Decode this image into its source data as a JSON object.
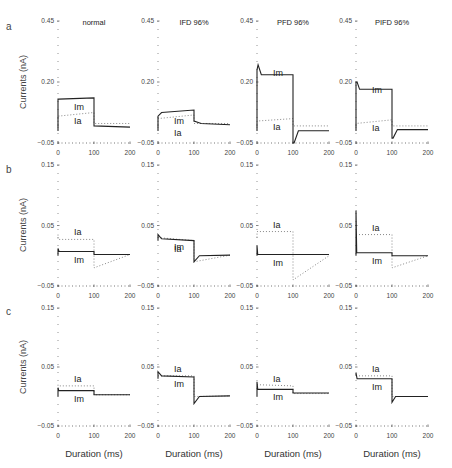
{
  "figure": {
    "xlabel": "Duration (ms)",
    "ylabel": "Currents (nA)",
    "columns": [
      "normal",
      "IFD 96%",
      "PFD 96%",
      "PIFD 96%"
    ],
    "rows": [
      "a",
      "b",
      "c"
    ],
    "labels": {
      "im": "Im",
      "ia": "Ia"
    }
  },
  "chart_data": {
    "type": "line",
    "title": "",
    "xlabel": "Duration (ms)",
    "ylabel": "Currents (nA)",
    "x_ticks": [
      0,
      100,
      200
    ],
    "xlim": [
      0,
      200
    ],
    "grid": false,
    "legend": "inline labels Im (solid) and Ia (dotted)",
    "rows": [
      {
        "row": "a",
        "ylim": [
          -0.05,
          0.45
        ],
        "y_ticks": [
          0.45,
          0.2,
          -0.05
        ],
        "panels": [
          {
            "title": "normal",
            "Im": {
              "x": [
                0,
                0,
                2,
                100,
                100,
                200
              ],
              "y": [
                0.0,
                0.13,
                0.13,
                0.135,
                0.02,
                0.015
              ]
            },
            "Ia": {
              "x": [
                0,
                0,
                100,
                100,
                200
              ],
              "y": [
                0.0,
                0.06,
                0.075,
                0.03,
                0.03
              ]
            }
          },
          {
            "title": "IFD 96%",
            "Im": {
              "x": [
                0,
                0,
                10,
                100,
                100,
                120,
                200
              ],
              "y": [
                0.0,
                0.06,
                0.075,
                0.085,
                0.04,
                0.03,
                0.025
              ]
            },
            "Ia": {
              "x": [
                0,
                0,
                100,
                100,
                200
              ],
              "y": [
                0.0,
                0.05,
                0.065,
                0.03,
                0.03
              ]
            }
          },
          {
            "title": "PFD 96%",
            "Im": {
              "x": [
                0,
                0,
                3,
                12,
                100,
                100,
                103,
                115,
                200
              ],
              "y": [
                0.0,
                0.25,
                0.27,
                0.23,
                0.23,
                -0.05,
                -0.05,
                0.0,
                0.0
              ]
            },
            "Ia": {
              "x": [
                0,
                0,
                100,
                100,
                200
              ],
              "y": [
                0.0,
                0.04,
                0.05,
                0.02,
                0.02
              ]
            }
          },
          {
            "title": "PIFD 96%",
            "Im": {
              "x": [
                0,
                0,
                3,
                10,
                100,
                100,
                103,
                115,
                200
              ],
              "y": [
                0.0,
                0.2,
                0.2,
                0.17,
                0.17,
                -0.03,
                -0.03,
                0.005,
                0.005
              ]
            },
            "Ia": {
              "x": [
                0,
                0,
                100,
                100,
                200
              ],
              "y": [
                0.0,
                0.03,
                0.045,
                0.02,
                0.02
              ]
            }
          }
        ]
      },
      {
        "row": "b",
        "ylim": [
          -0.05,
          0.15
        ],
        "y_ticks": [
          0.15,
          0.05,
          -0.05
        ],
        "panels": [
          {
            "title": "normal",
            "Im": {
              "x": [
                0,
                0,
                3,
                100,
                100,
                200
              ],
              "y": [
                0.0,
                0.012,
                0.007,
                0.007,
                0.002,
                0.002
              ]
            },
            "Ia": {
              "x": [
                0,
                0,
                100,
                100,
                200
              ],
              "y": [
                0.035,
                0.027,
                0.027,
                -0.02,
                0.002
              ]
            }
          },
          {
            "title": "IFD 96%",
            "Im": {
              "x": [
                0,
                0,
                10,
                100,
                100,
                115,
                200
              ],
              "y": [
                0.025,
                0.035,
                0.028,
                0.025,
                -0.01,
                0.0,
                0.001
              ]
            },
            "Ia": {
              "x": [
                0,
                0,
                100,
                100,
                200
              ],
              "y": [
                0.03,
                0.03,
                0.025,
                -0.01,
                0.001
              ]
            }
          },
          {
            "title": "PFD 96%",
            "Im": {
              "x": [
                0,
                0,
                2,
                100,
                200
              ],
              "y": [
                0.0,
                0.017,
                0.002,
                0.002,
                0.002
              ]
            },
            "Ia": {
              "x": [
                0,
                0,
                100,
                100,
                200
              ],
              "y": [
                0.03,
                0.04,
                0.04,
                -0.04,
                0.0
              ]
            }
          },
          {
            "title": "PIFD 96%",
            "Im": {
              "x": [
                0,
                0,
                2,
                100,
                100,
                200
              ],
              "y": [
                0.0,
                0.075,
                0.005,
                0.005,
                0.0,
                0.0
              ]
            },
            "Ia": {
              "x": [
                0,
                0,
                100,
                100,
                200
              ],
              "y": [
                0.035,
                0.035,
                0.035,
                -0.02,
                0.0
              ]
            }
          }
        ]
      },
      {
        "row": "c",
        "ylim": [
          -0.05,
          0.15
        ],
        "y_ticks": [
          0.15,
          0.05,
          -0.05
        ],
        "panels": [
          {
            "title": "normal",
            "Im": {
              "x": [
                0,
                0,
                2,
                100,
                100,
                200
              ],
              "y": [
                0.0,
                0.015,
                0.01,
                0.01,
                0.003,
                0.003
              ]
            },
            "Ia": {
              "x": [
                0,
                0,
                100,
                100,
                200
              ],
              "y": [
                0.02,
                0.018,
                0.018,
                0.003,
                0.003
              ]
            }
          },
          {
            "title": "IFD 96%",
            "Im": {
              "x": [
                0,
                0,
                10,
                100,
                100,
                115,
                200
              ],
              "y": [
                0.03,
                0.042,
                0.035,
                0.033,
                -0.012,
                0.0,
                0.001
              ]
            },
            "Ia": {
              "x": [
                0,
                0,
                100,
                100,
                200
              ],
              "y": [
                0.035,
                0.035,
                0.035,
                0.0,
                0.001
              ]
            }
          },
          {
            "title": "PFD 96%",
            "Im": {
              "x": [
                0,
                0,
                2,
                100,
                100,
                200
              ],
              "y": [
                0.0,
                0.025,
                0.012,
                0.012,
                0.006,
                0.006
              ]
            },
            "Ia": {
              "x": [
                0,
                0,
                100,
                100,
                200
              ],
              "y": [
                0.02,
                0.02,
                0.018,
                0.005,
                0.005
              ]
            }
          },
          {
            "title": "PIFD 96%",
            "Im": {
              "x": [
                0,
                0,
                3,
                100,
                100,
                110,
                200
              ],
              "y": [
                0.035,
                0.04,
                0.03,
                0.03,
                -0.01,
                0.0,
                0.0
              ]
            },
            "Ia": {
              "x": [
                0,
                0,
                100,
                100,
                200
              ],
              "y": [
                0.035,
                0.035,
                0.035,
                0.0,
                0.0
              ]
            }
          }
        ]
      }
    ]
  }
}
